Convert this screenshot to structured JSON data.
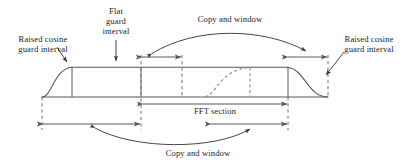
{
  "figure": {
    "type": "signal-timing-diagram",
    "title": "",
    "labels": {
      "raised_cosine_left": "Raised cosine\nguard interval",
      "flat_guard": "Flat\nguard\ninterval",
      "copy_window_top": "Copy and window",
      "raised_cosine_right": "Raised cosine\nguard interval",
      "fft_section": "FFT section",
      "copy_window_bottom": "Copy and window"
    },
    "colors": {
      "ink": "#231f20",
      "line": "#58585b",
      "background": "#ffffff"
    },
    "geometry": {
      "baseline_y": 97,
      "plateau_y": 67,
      "pulse_start_x": 42,
      "ramp_up_end_x": 72,
      "ramp_down_start_x": 287,
      "pulse_end_x": 328,
      "dashed_guides_x": [
        42,
        141,
        182,
        288,
        328
      ],
      "solid_guides_x": [
        72,
        141,
        288
      ],
      "top_arrow_y": 57,
      "top_arrow_left_span": [
        141,
        182
      ],
      "top_arrow_right_span": [
        287,
        328
      ],
      "fft_arrow_y": 104,
      "fft_arrow_span": [
        142,
        288
      ],
      "bottom_arrow_y": 124,
      "bottom_arrow_left_span": [
        42,
        141
      ],
      "bottom_arrow_right_span": [
        210,
        288
      ]
    }
  }
}
